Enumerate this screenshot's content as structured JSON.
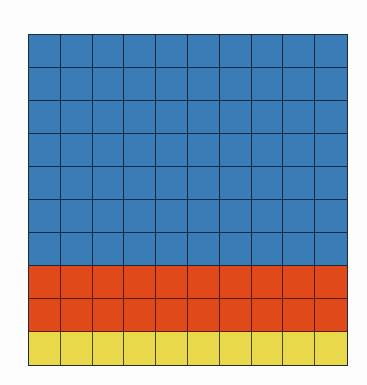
{
  "diagram": {
    "type": "10x10 percentage grid",
    "rows": 10,
    "columns": 10,
    "total_cells": 100
  },
  "segments": [
    {
      "name": "blue",
      "rows": 7,
      "cells": 70,
      "color": "#3a7cb5"
    },
    {
      "name": "red",
      "rows": 2,
      "cells": 20,
      "color": "#e04a1a"
    },
    {
      "name": "yellow",
      "rows": 1,
      "cells": 10,
      "color": "#e8d84a"
    }
  ],
  "row_colors": [
    "blue",
    "blue",
    "blue",
    "blue",
    "blue",
    "blue",
    "blue",
    "red",
    "red",
    "yellow"
  ],
  "grid_line_color": "#1c2b40"
}
